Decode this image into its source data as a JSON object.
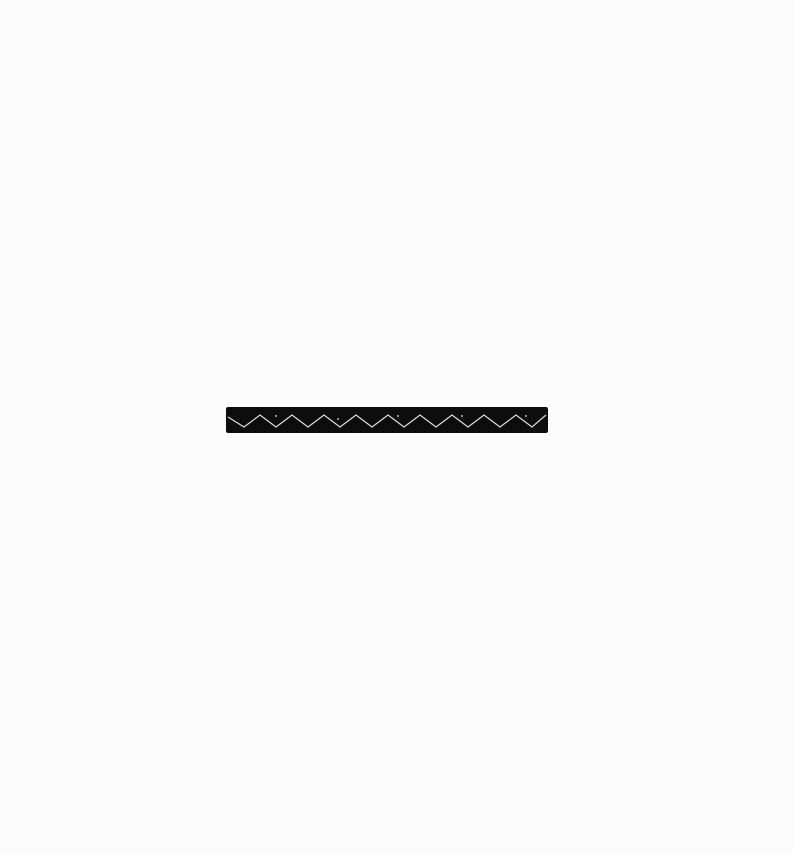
{
  "image": {
    "description": "Black band with white zigzag pattern on white background",
    "background_color": "#fbfbfb",
    "band": {
      "color": "#0d0d0d",
      "pattern": "zigzag",
      "pattern_color": "#d9d9d9"
    }
  }
}
